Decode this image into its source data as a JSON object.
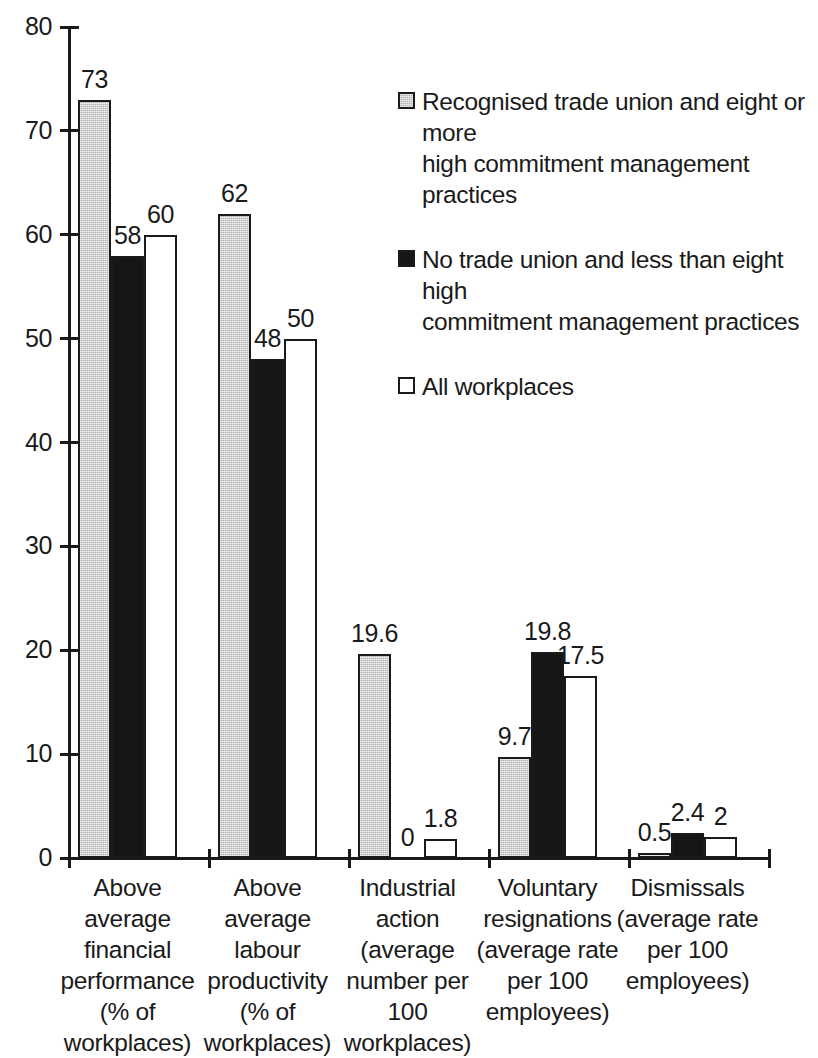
{
  "chart_data": {
    "type": "bar",
    "title": "",
    "subtitle": "",
    "xlabel": "",
    "ylabel": "",
    "ylim": [
      0,
      80
    ],
    "ytick_labels": [
      "0",
      "10",
      "20",
      "30",
      "40",
      "50",
      "60",
      "70",
      "80"
    ],
    "ytick_values": [
      0,
      10,
      20,
      30,
      40,
      50,
      60,
      70,
      80
    ],
    "grid": false,
    "legend_position": "right-top",
    "categories": [
      "Above average financial performance (% of workplaces)",
      "Above average labour productivity (% of workplaces)",
      "Industrial action (average number per 100 workplaces)",
      "Voluntary resignations (average rate per 100 employees)",
      "Dismissals (average rate per 100 employees)"
    ],
    "category_lines": [
      [
        "Above",
        "average",
        "financial",
        "performance",
        "(% of",
        "workplaces)"
      ],
      [
        "Above",
        "average",
        "labour",
        "productivity",
        "(% of",
        "workplaces)"
      ],
      [
        "Industrial",
        "action",
        "(average",
        "number per",
        "100",
        "workplaces)"
      ],
      [
        "Voluntary",
        "resignations",
        "(average rate",
        "per 100",
        "employees)"
      ],
      [
        "Dismissals",
        "(average rate",
        "per 100",
        "employees)"
      ]
    ],
    "series": [
      {
        "name": "Recognised trade union and eight or more high commitment management practices",
        "style": "grey",
        "values": [
          73,
          62,
          19.6,
          9.7,
          0.5
        ],
        "labels": [
          "73",
          "62",
          "19.6",
          "9.7",
          "0.5"
        ]
      },
      {
        "name": "No trade union and less than eight high commitment management practices",
        "style": "black",
        "values": [
          58,
          48,
          0,
          19.8,
          2.4
        ],
        "labels": [
          "58",
          "48",
          "0",
          "19.8",
          "2.4"
        ]
      },
      {
        "name": "All workplaces",
        "style": "white",
        "values": [
          60,
          50,
          1.8,
          17.5,
          2
        ],
        "labels": [
          "60",
          "50",
          "1.8",
          "17.5",
          "2"
        ]
      }
    ]
  },
  "legend": {
    "items": [
      {
        "swatch": "grey",
        "lines": [
          "Recognised trade union and eight or more",
          "high commitment management",
          "practices"
        ]
      },
      {
        "swatch": "black",
        "lines": [
          "No trade union and less than eight high",
          "commitment management practices"
        ]
      },
      {
        "swatch": "white",
        "lines": [
          "All workplaces"
        ]
      }
    ]
  },
  "colors": {
    "series_grey": "#b4b4b4",
    "series_black": "#161616",
    "series_white": "#ffffff",
    "axis": "#1a1a1a",
    "text": "#1a1a1a",
    "background": "#ffffff"
  }
}
